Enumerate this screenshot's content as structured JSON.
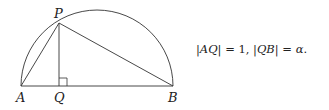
{
  "diagram": {
    "type": "semicircle-right-triangle",
    "points": {
      "A": {
        "label": "A",
        "x": 21,
        "y": 86
      },
      "B": {
        "label": "B",
        "x": 173,
        "y": 86
      },
      "P": {
        "label": "P",
        "x": 59,
        "y": 23
      },
      "Q": {
        "label": "Q",
        "x": 59,
        "y": 86
      }
    },
    "segments": [
      "AB",
      "AP",
      "PB",
      "PQ"
    ],
    "arc": {
      "center_x": 97,
      "center_y": 86,
      "radius": 76
    },
    "right_angle_at": "Q",
    "stroke_color": "#333333"
  },
  "formula": {
    "part1_lhs": "|AQ|",
    "part1_eq": " = 1, ",
    "part2_lhs": "|QB|",
    "part2_eq": " = ",
    "part2_rhs": "α",
    "end": "."
  }
}
